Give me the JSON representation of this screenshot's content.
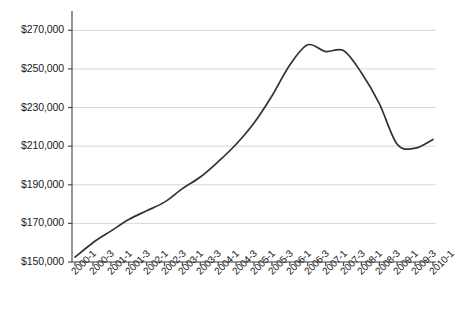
{
  "chart_data": {
    "type": "line",
    "title": "",
    "xlabel": "",
    "ylabel": "",
    "ylim": [
      150000,
      280000
    ],
    "ytick_values": [
      150000,
      170000,
      190000,
      210000,
      230000,
      250000,
      270000
    ],
    "ytick_labels": [
      "$150,000",
      "$170,000",
      "$190,000",
      "$210,000",
      "$230,000",
      "$250,000",
      "$270,000"
    ],
    "grid": "horizontal",
    "legend": "none",
    "line_color": "#333333",
    "gridline_color": "#d8d8d8",
    "axis_color": "#4d4d4d",
    "categories": [
      "2000-1",
      "2000-3",
      "2001-1",
      "2001-3",
      "2002-1",
      "2002-3",
      "2003-1",
      "2003-3",
      "2004-1",
      "2004-3",
      "2005-1",
      "2005-3",
      "2006-1",
      "2006-3",
      "2007-1",
      "2007-3",
      "2008-1",
      "2008-3",
      "2009-1",
      "2009-3",
      "2010-1"
    ],
    "values": [
      152500,
      160000,
      166000,
      172000,
      176500,
      181000,
      188000,
      194000,
      202000,
      211000,
      222000,
      236000,
      252000,
      262500,
      259000,
      259500,
      248000,
      232000,
      211000,
      209000,
      213500
    ]
  }
}
